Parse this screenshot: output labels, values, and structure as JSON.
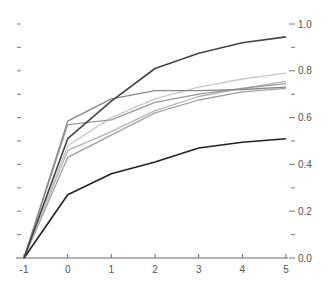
{
  "chart_data": {
    "type": "line",
    "title": "",
    "xlabel": "",
    "ylabel": "",
    "x": [
      -1,
      0,
      1,
      2,
      3,
      4,
      5
    ],
    "xlim": [
      -1,
      5
    ],
    "ylim": [
      0,
      1.0
    ],
    "x_ticks": [
      "-1",
      "0",
      "1",
      "2",
      "3",
      "4",
      "5"
    ],
    "y_ticks": [
      "0.0",
      "0.2",
      "0.4",
      "0.6",
      "0.8",
      "1.0"
    ],
    "y_axis_position": "right",
    "grid": false,
    "legend": null,
    "series": [
      {
        "name": "series-1",
        "color": "#444444",
        "width": 1.6,
        "values": [
          0,
          0.51,
          0.67,
          0.81,
          0.875,
          0.92,
          0.945
        ]
      },
      {
        "name": "series-2",
        "color": "#222222",
        "width": 1.6,
        "values": [
          0,
          0.27,
          0.36,
          0.41,
          0.47,
          0.495,
          0.51
        ]
      },
      {
        "name": "series-3",
        "color": "#888888",
        "width": 1.3,
        "values": [
          0,
          0.585,
          0.68,
          0.715,
          0.715,
          0.72,
          0.73
        ]
      },
      {
        "name": "series-4",
        "color": "#999999",
        "width": 1.3,
        "values": [
          0,
          0.57,
          0.59,
          0.665,
          0.7,
          0.725,
          0.745
        ]
      },
      {
        "name": "series-5",
        "color": "#c8c8c8",
        "width": 1.3,
        "values": [
          0,
          0.48,
          0.6,
          0.68,
          0.73,
          0.765,
          0.79
        ]
      },
      {
        "name": "series-6",
        "color": "#b4b4b4",
        "width": 1.3,
        "values": [
          0,
          0.46,
          0.54,
          0.63,
          0.69,
          0.725,
          0.755
        ]
      },
      {
        "name": "series-7",
        "color": "#a0a0a0",
        "width": 1.3,
        "values": [
          0,
          0.43,
          0.525,
          0.62,
          0.675,
          0.71,
          0.725
        ]
      }
    ]
  }
}
